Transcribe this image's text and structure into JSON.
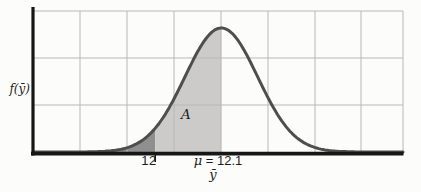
{
  "labels": {
    "y_axis": "f(ȳ)",
    "x_tick_12": "12",
    "mean_mu": "μ",
    "mean_rest": "= 12.1",
    "x_axis": "ȳ",
    "region_a": "A"
  },
  "chart_data": {
    "type": "area",
    "subtype": "normal-density-curve",
    "title": "",
    "xlabel": "ȳ",
    "ylabel": "f(ȳ)",
    "mean": 12.1,
    "mean_label": "μ = 12.1",
    "sigma_estimate": 0.055,
    "x_range": [
      11.815,
      12.375
    ],
    "x_ticks": [
      {
        "value": 12.0,
        "label": "12"
      }
    ],
    "shaded_regions": [
      {
        "name": "left-tail-below-12",
        "x_from": 11.815,
        "x_to": 12.0,
        "fill": "#8f8f8f"
      },
      {
        "name": "region-A-12-to-mean",
        "x_from": 12.0,
        "x_to": 12.1,
        "fill": "#cccbc9",
        "label": "A"
      }
    ],
    "grid": true,
    "legend": false,
    "colors": {
      "curve": "#4e4e4e",
      "grid": "#b8b8b5",
      "axis": "#161616",
      "background": "#fcfcfa",
      "tail_fill": "#8f8f8f",
      "region_a_fill": "#cccbc9"
    }
  }
}
